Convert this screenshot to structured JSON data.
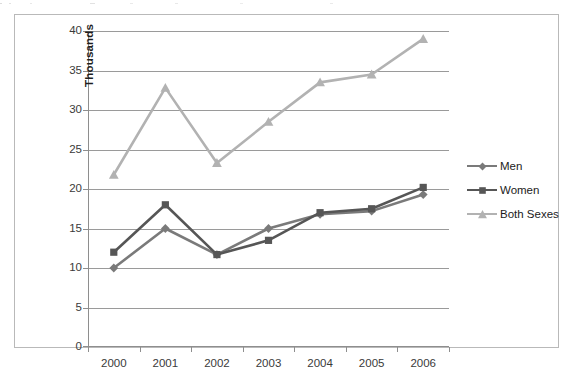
{
  "chart_data": {
    "type": "line",
    "title": "",
    "xlabel": "",
    "ylabel": "Thousands",
    "categories": [
      "2000",
      "2001",
      "2002",
      "2003",
      "2004",
      "2005",
      "2006"
    ],
    "x": [
      2000,
      2001,
      2002,
      2003,
      2004,
      2005,
      2006
    ],
    "ylim": [
      0,
      40
    ],
    "ytick_step": 5,
    "yticks": [
      "40",
      "35",
      "30",
      "25",
      "20",
      "15",
      "10",
      "5",
      "0"
    ],
    "ytick_values": [
      40,
      35,
      30,
      25,
      20,
      15,
      10,
      5,
      0
    ],
    "grid": true,
    "grid_axis": "y",
    "legend_position": "right",
    "series": [
      {
        "name": "Men",
        "marker": "diamond",
        "color": "#7a7a7a",
        "values": [
          10.0,
          15.0,
          11.7,
          15.0,
          16.8,
          17.2,
          19.3
        ]
      },
      {
        "name": "Women",
        "marker": "square",
        "color": "#565656",
        "values": [
          12.0,
          18.0,
          11.7,
          13.5,
          17.0,
          17.5,
          20.2
        ]
      },
      {
        "name": "Both Sexes",
        "marker": "triangle",
        "color": "#b2b2b2",
        "values": [
          21.8,
          32.8,
          23.3,
          28.5,
          33.5,
          34.5,
          39.0
        ]
      }
    ]
  },
  "legend": {
    "items": [
      {
        "label": "Men"
      },
      {
        "label": "Women"
      },
      {
        "label": "Both Sexes"
      }
    ]
  },
  "colors": {
    "men": "#7a7a7a",
    "women": "#565656",
    "both_sexes": "#b2b2b2",
    "gridline": "#9a9a9a",
    "axis": "#8e8e8e",
    "frame_border": "#b9b9b9",
    "background": "#ffffff",
    "tick_label": "#3a3a3a",
    "axis_title": "#1e1e1e"
  }
}
